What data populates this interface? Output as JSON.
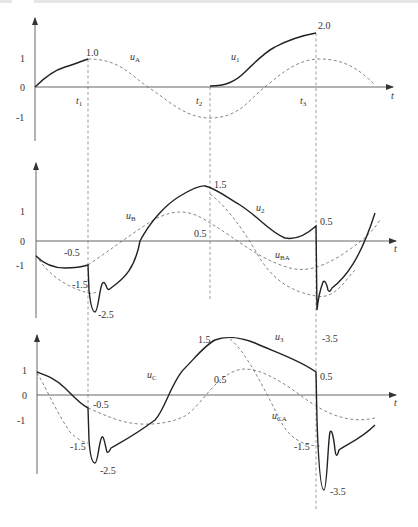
{
  "figure": {
    "type": "waveform-diagram",
    "panels": [
      {
        "id": "top",
        "y_ticks": [
          "1",
          "0",
          "-1"
        ],
        "x_axis_label": "t",
        "time_markers": [
          {
            "label": "t",
            "sub": "1"
          },
          {
            "label": "t",
            "sub": "2"
          },
          {
            "label": "t",
            "sub": "3"
          }
        ],
        "curve_labels": [
          {
            "label": "u",
            "sub": "A"
          },
          {
            "label": "u",
            "sub": "1"
          }
        ],
        "value_labels": [
          "1.0",
          "2.0"
        ]
      },
      {
        "id": "middle",
        "y_ticks": [
          "1",
          "0",
          "-1"
        ],
        "x_axis_label": "t",
        "curve_labels": [
          {
            "label": "u",
            "sub": "B"
          },
          {
            "label": "u",
            "sub": "2"
          },
          {
            "label": "u",
            "sub": "BA"
          }
        ],
        "value_labels": [
          "-0.5",
          "-1.5",
          "-2.5",
          "1.5",
          "0.5",
          "0.5",
          "-3.5"
        ]
      },
      {
        "id": "bottom",
        "y_ticks": [
          "1",
          "0",
          "-1"
        ],
        "x_axis_label": "t",
        "curve_labels": [
          {
            "label": "u",
            "sub": "C"
          },
          {
            "label": "u",
            "sub": "3"
          },
          {
            "label": "u",
            "sub": "CA"
          }
        ],
        "value_labels": [
          "-0.5",
          "-1.5",
          "-2.5",
          "1.5",
          "0.5",
          "0.5",
          "-1.5",
          "-3.5"
        ]
      }
    ]
  },
  "colors": {
    "solid_curve": "#222222",
    "dashed_curve": "#666666",
    "axis": "#555555",
    "text": "#333333"
  }
}
